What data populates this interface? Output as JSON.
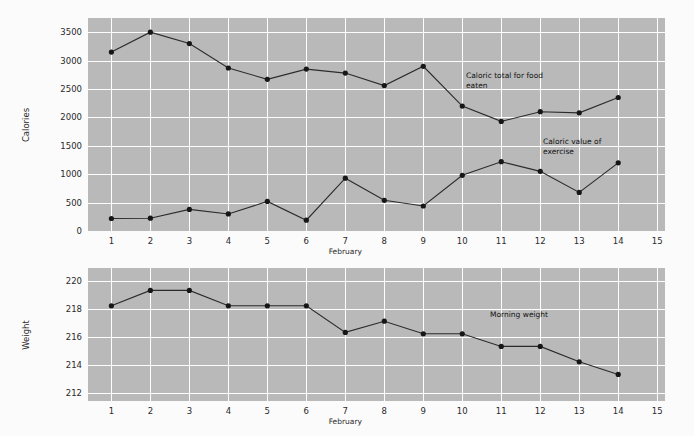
{
  "page": {
    "faint_header_text": "",
    "background_color": "#fbfbfb",
    "plot_background_color": "#b9b9b9",
    "gridline_color": "#fdfdfd",
    "series_color": "#2b2b2b"
  },
  "chart_data": [
    {
      "type": "line",
      "id": "calories-chart",
      "title": "",
      "xlabel": "February",
      "ylabel": "Calories",
      "x": [
        1,
        2,
        3,
        4,
        5,
        6,
        7,
        8,
        9,
        10,
        11,
        12,
        13,
        14
      ],
      "xticks": [
        1,
        2,
        3,
        4,
        5,
        6,
        7,
        8,
        9,
        10,
        11,
        12,
        13,
        14,
        15
      ],
      "xlim": [
        0.4,
        15.2
      ],
      "ylim": [
        0,
        3750
      ],
      "yticks": [
        0,
        500,
        1000,
        1500,
        2000,
        2500,
        3000,
        3500
      ],
      "grid": true,
      "legend_position": "inline-annotation",
      "series": [
        {
          "name": "Caloric total for food eaten",
          "annotation": "Caloric total for food\neaten",
          "values": [
            3150,
            3500,
            3300,
            2870,
            2670,
            2850,
            2780,
            2560,
            2900,
            2200,
            1930,
            2100,
            2080,
            2350
          ]
        },
        {
          "name": "Caloric value of exercise",
          "annotation": "Caloric value of\nexercise",
          "values": [
            220,
            225,
            380,
            300,
            520,
            190,
            930,
            540,
            440,
            980,
            1220,
            1050,
            680,
            1200
          ]
        }
      ]
    },
    {
      "type": "line",
      "id": "weight-chart",
      "title": "",
      "xlabel": "February",
      "ylabel": "Weight",
      "x": [
        1,
        2,
        3,
        4,
        5,
        6,
        7,
        8,
        9,
        10,
        11,
        12,
        13,
        14
      ],
      "xticks": [
        1,
        2,
        3,
        4,
        5,
        6,
        7,
        8,
        9,
        10,
        11,
        12,
        13,
        14,
        15
      ],
      "xlim": [
        0.4,
        15.2
      ],
      "ylim": [
        211.4,
        220.9
      ],
      "yticks": [
        212,
        214,
        216,
        218,
        220
      ],
      "grid": true,
      "legend_position": "inline-annotation",
      "series": [
        {
          "name": "Morning weight",
          "annotation": "Morning weight",
          "values": [
            218.2,
            219.3,
            219.3,
            218.2,
            218.2,
            218.2,
            216.3,
            217.1,
            216.2,
            216.2,
            215.3,
            215.3,
            214.2,
            213.3
          ]
        }
      ]
    }
  ]
}
